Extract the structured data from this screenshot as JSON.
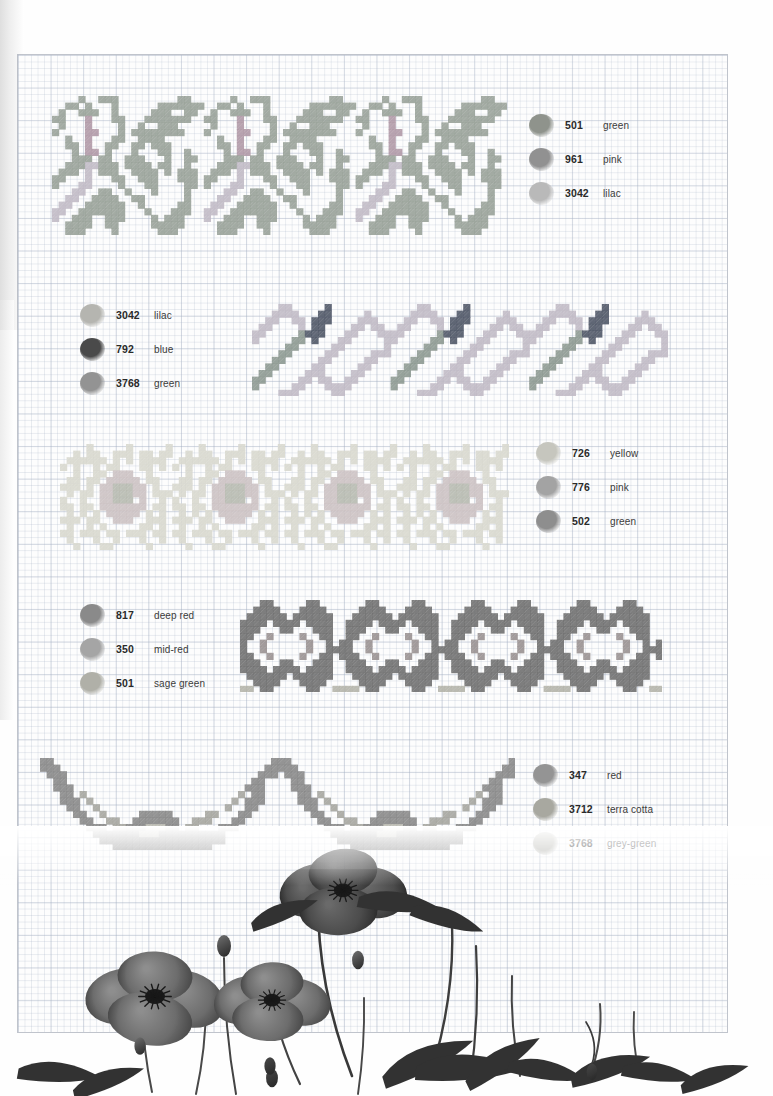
{
  "page": {
    "kind": "cross-stitch-pattern-sheet",
    "background_color": "#ffffff",
    "sheet": {
      "color": "#fdfdfd",
      "grid_line_color": "#b6c0d0",
      "bold_grid_color": "#a8b2c4"
    }
  },
  "bands": [
    {
      "id": "band-1",
      "name": "lilac-and-green-sprig-border",
      "left": 52,
      "top": 96,
      "cell": 6.6,
      "cols": 70,
      "rows": 21,
      "repeats": 3,
      "repeat_cols": 23,
      "palette": [
        "#9aa39a",
        "#b29aa8",
        "#c3bcc9"
      ],
      "legend_ref": "legend-1"
    },
    {
      "id": "band-2",
      "name": "blue-diagonal-zigzag-border",
      "left": 252,
      "top": 304,
      "cell": 6.6,
      "cols": 64,
      "rows": 14,
      "repeats": 3,
      "repeat_cols": 21,
      "palette": [
        "#c3bcc9",
        "#4e5566",
        "#8e9a92"
      ],
      "legend_ref": "legend-2"
    },
    {
      "id": "band-3",
      "name": "pale-rose-and-yellow-flower-border",
      "left": 60,
      "top": 444,
      "cell": 6.6,
      "cols": 70,
      "rows": 16,
      "repeats": 4,
      "repeat_cols": 17,
      "palette": [
        "#dcdcd2",
        "#cfc5c6",
        "#b9bdb2"
      ],
      "legend_ref": "legend-3"
    },
    {
      "id": "band-4",
      "name": "red-poppy-star-border",
      "left": 240,
      "top": 600,
      "cell": 6.6,
      "cols": 66,
      "rows": 14,
      "repeats": 4,
      "repeat_cols": 16,
      "palette": [
        "#6f6f6f",
        "#9a9292",
        "#b6b6ac"
      ],
      "legend_ref": "legend-4"
    },
    {
      "id": "band-5",
      "name": "poppy-swag-garland-border",
      "left": 40,
      "top": 758,
      "cell": 6.6,
      "cols": 74,
      "rows": 14,
      "repeats": 2,
      "repeat_cols": 36,
      "palette": [
        "#888888",
        "#a6a6a0",
        "#bdbdb4"
      ],
      "legend_ref": "legend-5"
    }
  ],
  "legends": [
    {
      "id": "legend-1",
      "left": 529,
      "top": 108,
      "rows": [
        {
          "code": "501",
          "name": "green",
          "swatch": "#8f938c"
        },
        {
          "code": "961",
          "name": "pink",
          "swatch": "#919191"
        },
        {
          "code": "3042",
          "name": "lilac",
          "swatch": "#b9b9b9"
        }
      ]
    },
    {
      "id": "legend-2",
      "left": 80,
      "top": 298,
      "rows": [
        {
          "code": "3042",
          "name": "lilac",
          "swatch": "#b5b5b0"
        },
        {
          "code": "792",
          "name": "blue",
          "swatch": "#4a4a4a"
        },
        {
          "code": "3768",
          "name": "green",
          "swatch": "#939393"
        }
      ]
    },
    {
      "id": "legend-3",
      "left": 536,
      "top": 436,
      "rows": [
        {
          "code": "726",
          "name": "yellow",
          "swatch": "#c6c6be"
        },
        {
          "code": "776",
          "name": "pink",
          "swatch": "#a3a3a3"
        },
        {
          "code": "502",
          "name": "green",
          "swatch": "#8e8e8e"
        }
      ]
    },
    {
      "id": "legend-4",
      "left": 80,
      "top": 598,
      "rows": [
        {
          "code": "817",
          "name": "deep red",
          "swatch": "#8a8a8a"
        },
        {
          "code": "350",
          "name": "mid-red",
          "swatch": "#a5a5a5"
        },
        {
          "code": "501",
          "name": "sage green",
          "swatch": "#b0b0a8"
        }
      ]
    },
    {
      "id": "legend-5",
      "left": 533,
      "top": 758,
      "rows": [
        {
          "code": "347",
          "name": "red",
          "swatch": "#949494"
        },
        {
          "code": "3712",
          "name": "terra cotta",
          "swatch": "#a8a8a0"
        },
        {
          "code": "3768",
          "name": "grey-green",
          "swatch": "#b4b4ae"
        }
      ]
    }
  ],
  "photo": {
    "name": "poppies-photograph",
    "description": "black and white photograph of poppy flowers, buds and leaves along the bottom of the page",
    "tone": "grayscale",
    "left": 0,
    "top": 826,
    "width": 773,
    "height": 270
  }
}
